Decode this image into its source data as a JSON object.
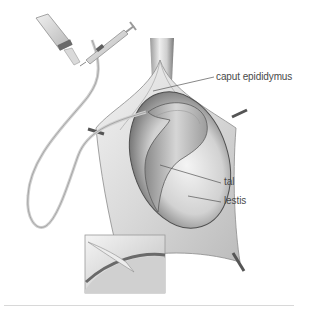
{
  "figure": {
    "labels": [
      {
        "id": "caput",
        "text": "caput epididymus",
        "x": 216,
        "y": 79
      },
      {
        "id": "tal",
        "text": "tal",
        "x": 224,
        "y": 182
      },
      {
        "id": "testis",
        "text": "lestis",
        "x": 224,
        "y": 201
      }
    ],
    "inset": {
      "description": "magnified view of micropipette tip entering tubule"
    },
    "colors": {
      "background": "#ffffff",
      "tissue_light": "#e6e6e6",
      "tissue_mid": "#bdbdbd",
      "tissue_dark": "#6e6e6e",
      "label_text": "#4a4a4a",
      "leader_line": "#555555",
      "divider": "#d8d8d8"
    }
  }
}
